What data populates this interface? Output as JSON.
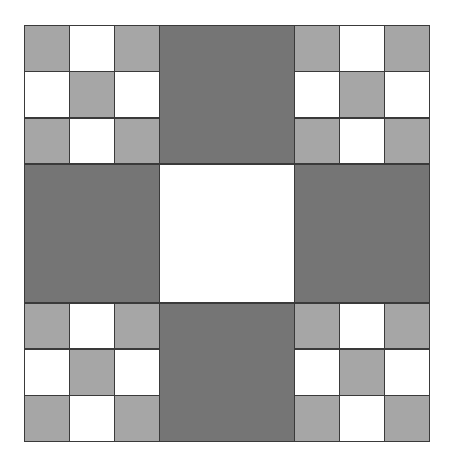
{
  "figure": {
    "canvas_width": 454,
    "canvas_height": 458,
    "background_color": "#ffffff"
  },
  "colors": {
    "light_gray": "#a6a6a6",
    "dark_gray": "#757575",
    "white": "#ffffff",
    "grid_line": "#3a3a3a"
  },
  "grid": {
    "outer_rows": 3,
    "outer_cols": 3,
    "inner_rows": 3,
    "inner_cols": 3
  },
  "chart_data": {
    "type": "heatmap",
    "xlabel": "",
    "ylabel": "",
    "categories": [
      "col-1",
      "col-2",
      "col-3"
    ],
    "blocks": [
      {
        "position": "top-left",
        "row": 0,
        "col": 0,
        "kind": "checker",
        "cells": [
          [
            "light_gray",
            "white",
            "light_gray"
          ],
          [
            "white",
            "light_gray",
            "white"
          ],
          [
            "light_gray",
            "white",
            "light_gray"
          ]
        ]
      },
      {
        "position": "top-center",
        "row": 0,
        "col": 1,
        "kind": "solid",
        "fill": "dark_gray"
      },
      {
        "position": "top-right",
        "row": 0,
        "col": 2,
        "kind": "checker",
        "cells": [
          [
            "light_gray",
            "white",
            "light_gray"
          ],
          [
            "white",
            "light_gray",
            "white"
          ],
          [
            "light_gray",
            "white",
            "light_gray"
          ]
        ]
      },
      {
        "position": "middle-left",
        "row": 1,
        "col": 0,
        "kind": "solid",
        "fill": "dark_gray"
      },
      {
        "position": "middle-center",
        "row": 1,
        "col": 1,
        "kind": "solid",
        "fill": "white"
      },
      {
        "position": "middle-right",
        "row": 1,
        "col": 2,
        "kind": "solid",
        "fill": "dark_gray"
      },
      {
        "position": "bottom-left",
        "row": 2,
        "col": 0,
        "kind": "checker",
        "cells": [
          [
            "light_gray",
            "white",
            "light_gray"
          ],
          [
            "white",
            "light_gray",
            "white"
          ],
          [
            "light_gray",
            "white",
            "light_gray"
          ]
        ]
      },
      {
        "position": "bottom-center",
        "row": 2,
        "col": 1,
        "kind": "solid",
        "fill": "dark_gray"
      },
      {
        "position": "bottom-right",
        "row": 2,
        "col": 2,
        "kind": "checker",
        "cells": [
          [
            "light_gray",
            "white",
            "light_gray"
          ],
          [
            "white",
            "light_gray",
            "white"
          ],
          [
            "light_gray",
            "white",
            "light_gray"
          ]
        ]
      }
    ]
  }
}
